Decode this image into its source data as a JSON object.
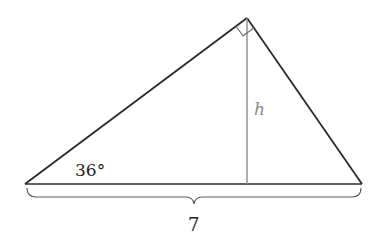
{
  "diagram": {
    "type": "right-triangle-with-altitude",
    "labels": {
      "angle": "36°",
      "altitude": "h",
      "base": "7"
    },
    "colors": {
      "triangle": "#2a2a2a",
      "altitude": "#8a8a8a",
      "brace": "#5a5a5a",
      "altitude_label": "#8a8a8a",
      "text": "#222222"
    },
    "geometry": {
      "left_vertex": [
        25,
        184
      ],
      "apex": [
        247,
        18
      ],
      "right_vertex": [
        362,
        184
      ],
      "altitude_foot": [
        247,
        184
      ]
    }
  }
}
